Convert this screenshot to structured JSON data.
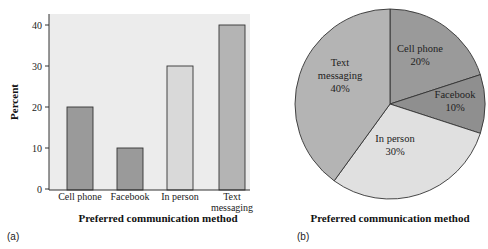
{
  "chart_data": [
    {
      "type": "bar",
      "panel_label": "(a)",
      "categories": [
        "Cell phone",
        "Facebook",
        "In person",
        "Text messaging"
      ],
      "category_lines": [
        [
          "Cell phone"
        ],
        [
          "Facebook"
        ],
        [
          "In person"
        ],
        [
          "Text",
          "messaging"
        ]
      ],
      "values": [
        20,
        10,
        30,
        40
      ],
      "colors": [
        "#9a9a9a",
        "#9a9a9a",
        "#d9d9d9",
        "#b4b4b4"
      ],
      "xlabel": "Preferred communication method",
      "ylabel": "Percent",
      "ylim": [
        0,
        42
      ],
      "yticks": [
        0,
        10,
        20,
        30,
        40
      ],
      "grid": false
    },
    {
      "type": "pie",
      "panel_label": "(b)",
      "title": "Preferred communication method",
      "slices": [
        {
          "label": "Cell phone",
          "value": 20,
          "pct": "20%",
          "color": "#9a9a9a"
        },
        {
          "label": "Facebook",
          "value": 10,
          "pct": "10%",
          "color": "#8f8f8f"
        },
        {
          "label": "In person",
          "value": 30,
          "pct": "30%",
          "color": "#e0e0e0"
        },
        {
          "label": "Text messaging",
          "value": 40,
          "pct": "40%",
          "color": "#b4b4b4"
        }
      ]
    }
  ]
}
